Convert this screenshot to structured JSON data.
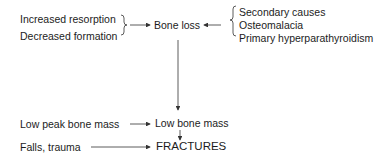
{
  "diagram": {
    "left_causes": [
      "Increased resorption",
      "Decreased formation"
    ],
    "center_top": "Bone loss",
    "right_causes": [
      "Secondary causes",
      "Osteomalacia",
      "Primary hyperparathyroidism"
    ],
    "low_peak": "Low peak bone mass",
    "low_bone_mass": "Low bone mass",
    "falls": "Falls, trauma",
    "fractures": "FRACTURES"
  },
  "colors": {
    "text": "#1c1c1c",
    "line": "#333333",
    "background": "#ffffff"
  }
}
